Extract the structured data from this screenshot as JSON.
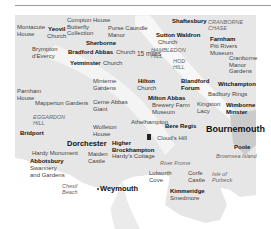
{
  "map": {
    "scale_label": "15 miles",
    "colors": {
      "land": "#e4e4e4",
      "land_light": "#eeeeee",
      "sea": "#ffffff",
      "conurbation": "#c8c8c8",
      "ridge": "#f7f7f7"
    },
    "places": [
      {
        "id": "montacute",
        "text": "Montacute\nHouse",
        "style": "reg"
      },
      {
        "id": "yeovil",
        "text": "Yeovil",
        "style": "b"
      },
      {
        "id": "yeovil_church",
        "text": "Church",
        "style": "reg"
      },
      {
        "id": "compton",
        "text": "Compton House\nButterfly\nCollection",
        "style": "reg"
      },
      {
        "id": "purse",
        "text": "Purse Caundle\nManor",
        "style": "reg"
      },
      {
        "id": "shaftesbury",
        "text": "Shaftesbury",
        "style": "b"
      },
      {
        "id": "cranborne_chase",
        "text": "CRANBORNE\nCHASE",
        "style": "i"
      },
      {
        "id": "sutton",
        "text": "Sutton Waldron",
        "style": "b"
      },
      {
        "id": "sutton_church",
        "text": "Church",
        "style": "reg"
      },
      {
        "id": "farnham",
        "text": "Farnham",
        "style": "b"
      },
      {
        "id": "pitt",
        "text": "Pitt Rivers\nMuseum",
        "style": "reg"
      },
      {
        "id": "sherborne",
        "text": "Sherborne",
        "style": "b"
      },
      {
        "id": "brympton",
        "text": "Brympton\nd'Evercy",
        "style": "reg"
      },
      {
        "id": "bradford",
        "text": "Bradford Abbas",
        "style": "b"
      },
      {
        "id": "bradford_church",
        "text": "Church",
        "style": "reg"
      },
      {
        "id": "hambledon",
        "text": "HAMBLEDON\nHILL",
        "style": "i"
      },
      {
        "id": "hod",
        "text": "HOD\nHILL",
        "style": "i"
      },
      {
        "id": "cranborne_manor",
        "text": "Cranborne\nManor\nGardens",
        "style": "reg"
      },
      {
        "id": "yetminster",
        "text": "Yetminster",
        "style": "b"
      },
      {
        "id": "yetminster_church",
        "text": "Church",
        "style": "reg"
      },
      {
        "id": "minterne",
        "text": "Minterne\nGardens",
        "style": "reg"
      },
      {
        "id": "hilton",
        "text": "Hilton",
        "style": "b"
      },
      {
        "id": "hilton_church",
        "text": "Church",
        "style": "reg"
      },
      {
        "id": "blandford",
        "text": "Blandford\nForum",
        "style": "b"
      },
      {
        "id": "witchampton",
        "text": "Witchampton",
        "style": "b"
      },
      {
        "id": "badbury",
        "text": "Badbury Rings",
        "style": "reg"
      },
      {
        "id": "parnham",
        "text": "Parnham\nHouse",
        "style": "reg"
      },
      {
        "id": "mapperton",
        "text": "Mapperton Gardens",
        "style": "reg"
      },
      {
        "id": "cerne",
        "text": "Cerne Abbas\nGiant",
        "style": "reg"
      },
      {
        "id": "milton",
        "text": "Milton Abbas",
        "style": "b"
      },
      {
        "id": "brewery",
        "text": "Brewery Farm\nMuseum",
        "style": "reg"
      },
      {
        "id": "kingston",
        "text": "Kingston\nLacy",
        "style": "reg"
      },
      {
        "id": "wimborne",
        "text": "Wimborne\nMinster",
        "style": "b"
      },
      {
        "id": "eggardon",
        "text": "EGGARDON\nHILL",
        "style": "i"
      },
      {
        "id": "athelhampton",
        "text": "Athelhampton",
        "style": "reg"
      },
      {
        "id": "bere",
        "text": "Bere Regis",
        "style": "b"
      },
      {
        "id": "bridport",
        "text": "Bridport",
        "style": "b"
      },
      {
        "id": "wolfeton",
        "text": "Wolfeton\nHouse",
        "style": "reg"
      },
      {
        "id": "bournemouth",
        "text": "Bournemouth",
        "style": "big"
      },
      {
        "id": "clouds",
        "text": "Cloud's Hill",
        "style": "reg"
      },
      {
        "id": "dorchester",
        "text": "Dorchester",
        "style": "town"
      },
      {
        "id": "higher",
        "text": "Higher\nBrockhampton",
        "style": "b"
      },
      {
        "id": "hardys_cottage",
        "text": "Hardy's Cottage",
        "style": "reg"
      },
      {
        "id": "poole",
        "text": "Poole",
        "style": "b"
      },
      {
        "id": "hardy_monument",
        "text": "Hardy Monument",
        "style": "reg"
      },
      {
        "id": "maiden",
        "text": "Maiden\nCastle",
        "style": "reg"
      },
      {
        "id": "brownsea",
        "text": "Brownsea Island",
        "style": "i"
      },
      {
        "id": "abbotsbury",
        "text": "Abbotsbury",
        "style": "b"
      },
      {
        "id": "swannery",
        "text": "Swannery\nand Gardens",
        "style": "reg"
      },
      {
        "id": "river_frome",
        "text": "River Frome",
        "style": "i"
      },
      {
        "id": "lulworth",
        "text": "Lulworth\nCove",
        "style": "reg"
      },
      {
        "id": "corfe",
        "text": "Corfe\nCastle",
        "style": "reg"
      },
      {
        "id": "purbeck",
        "text": "Isle of\nPurbeck",
        "style": "i"
      },
      {
        "id": "chesil",
        "text": "Chesil\nBeach",
        "style": "i"
      },
      {
        "id": "weymouth",
        "text": "Weymouth",
        "style": "town"
      },
      {
        "id": "kimmeridge",
        "text": "Kimmeridge",
        "style": "b"
      },
      {
        "id": "smedmore",
        "text": "Smedmore",
        "style": "reg"
      }
    ]
  }
}
